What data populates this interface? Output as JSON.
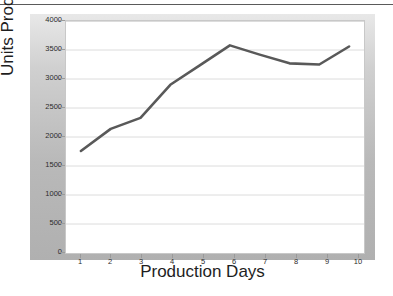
{
  "chart_data": {
    "type": "line",
    "title": "",
    "xlabel": "Production Days",
    "ylabel": "Units Produced",
    "categories": [
      "1",
      "2",
      "3",
      "4",
      "5",
      "6",
      "7",
      "8",
      "9",
      "10"
    ],
    "x": [
      1,
      2,
      3,
      4,
      5,
      6,
      7,
      8,
      9,
      10
    ],
    "values": [
      1760,
      2140,
      2330,
      2900,
      3240,
      3580,
      3420,
      3270,
      3250,
      3560
    ],
    "series": [
      {
        "name": "Units Produced",
        "values": [
          1760,
          2140,
          2330,
          2900,
          3240,
          3580,
          3420,
          3270,
          3250,
          3560
        ],
        "color": "#595959"
      }
    ],
    "ylim": [
      0,
      4000
    ],
    "yticks": [
      0,
      500,
      1000,
      1500,
      2000,
      2500,
      3000,
      3500,
      4000
    ],
    "ytick_labels": [
      "0",
      "500",
      "1000",
      "1500",
      "2000",
      "2500",
      "3000",
      "3500",
      "4000"
    ],
    "xlim": [
      0.5,
      10.5
    ],
    "grid": "horizontal",
    "legend": "none",
    "line_color": "#595959",
    "line_width": 2.4,
    "plot_background": "#ffffff",
    "panel_background": "#cfcfcf",
    "gridline_color": "#d9d9d9"
  }
}
